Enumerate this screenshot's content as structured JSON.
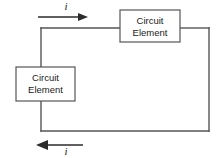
{
  "figure": {
    "type": "circuit-diagram",
    "background_color": "#ffffff",
    "wire_color": "#555555",
    "arrow_color": "#2b2b2b",
    "text_color": "#1a1a1a",
    "elements": [
      {
        "id": "top-element",
        "label_line1": "Circuit",
        "label_line2": "Element",
        "x": 120,
        "y": 10,
        "width": 60,
        "height": 32
      },
      {
        "id": "left-element",
        "label_line1": "Circuit",
        "label_line2": "Element",
        "x": 16,
        "y": 67,
        "width": 59,
        "height": 34
      }
    ],
    "wires": [
      {
        "id": "top-wire",
        "path": "M 41 28 L 120 28"
      },
      {
        "id": "right-top-wire",
        "path": "M 180 28 L 209 28"
      },
      {
        "id": "right-wire",
        "path": "M 209 28 L 209 131"
      },
      {
        "id": "bottom-wire",
        "path": "M 209 131 L 41 131"
      },
      {
        "id": "left-upper-wire",
        "path": "M 41 28 L 41 67"
      },
      {
        "id": "left-lower-wire",
        "path": "M 41 101 L 41 131"
      }
    ],
    "current_arrows": [
      {
        "id": "top-current-arrow",
        "direction": "right",
        "label": "i",
        "line": "M 38 17 L 84 17",
        "head": "88,17 78,13 78,21",
        "label_x": 66,
        "label_y": 6
      },
      {
        "id": "bottom-current-arrow",
        "direction": "left",
        "label": "i",
        "line": "M 83 145 L 44 145",
        "head": "36,145 48,140 48,150",
        "label_x": 66,
        "label_y": 152
      }
    ]
  }
}
